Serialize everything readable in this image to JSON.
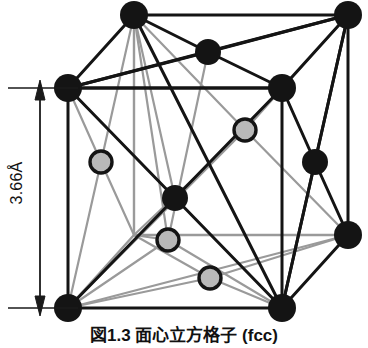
{
  "figure": {
    "caption": "図1.3  面心立方格子 (fcc)",
    "dimension_label": "3.66Å",
    "lattice_type": "fcc",
    "lattice_parameter": "3.66",
    "lattice_parameter_unit": "Å"
  },
  "colors": {
    "atom_dark_fill": "#141414",
    "atom_light_fill": "#b9b9b9",
    "atom_light_stroke": "#141414",
    "bond_front": "#141414",
    "bond_back": "#9a9a9a",
    "dimension_line": "#1a1a1a",
    "background": "#ffffff"
  },
  "geometry": {
    "projection": "oblique",
    "depth_offset_x": 66,
    "depth_offset_y": -73,
    "cube_front": {
      "top_left": [
        68,
        88
      ],
      "top_right": [
        282,
        88
      ],
      "bottom_right": [
        282,
        308
      ],
      "bottom_left": [
        68,
        308
      ]
    },
    "cube_back": {
      "top_left": [
        134,
        15
      ],
      "top_right": [
        348,
        15
      ],
      "bottom_right": [
        348,
        235
      ],
      "bottom_left": [
        134,
        235
      ]
    }
  },
  "atoms": {
    "corner_atoms": [
      {
        "name": "corner-front-top-left",
        "x": 68,
        "y": 88,
        "r": 13,
        "shade": "dark"
      },
      {
        "name": "corner-front-top-right",
        "x": 282,
        "y": 88,
        "r": 13,
        "shade": "dark"
      },
      {
        "name": "corner-front-bottom-left",
        "x": 68,
        "y": 308,
        "r": 13,
        "shade": "dark"
      },
      {
        "name": "corner-front-bottom-right",
        "x": 282,
        "y": 308,
        "r": 13,
        "shade": "dark"
      },
      {
        "name": "corner-back-top-left",
        "x": 134,
        "y": 15,
        "r": 13,
        "shade": "dark"
      },
      {
        "name": "corner-back-top-right",
        "x": 348,
        "y": 15,
        "r": 13,
        "shade": "dark"
      },
      {
        "name": "corner-back-bottom-right",
        "x": 348,
        "y": 235,
        "r": 13,
        "shade": "dark"
      },
      {
        "name": "corner-back-bottom-left",
        "x": 134,
        "y": 235,
        "r": 13,
        "shade": "hidden"
      }
    ],
    "face_center_atoms": [
      {
        "name": "face-center-top",
        "x": 208,
        "y": 52,
        "r": 13,
        "shade": "dark"
      },
      {
        "name": "face-center-front",
        "x": 175,
        "y": 198,
        "r": 13,
        "shade": "dark"
      },
      {
        "name": "face-center-right",
        "x": 315,
        "y": 162,
        "r": 13,
        "shade": "dark"
      },
      {
        "name": "face-center-back",
        "x": 245,
        "y": 130,
        "r": 11,
        "shade": "light"
      },
      {
        "name": "face-center-left",
        "x": 101,
        "y": 162,
        "r": 11,
        "shade": "light"
      },
      {
        "name": "face-center-bottom-left",
        "x": 168,
        "y": 240,
        "r": 11,
        "shade": "light"
      },
      {
        "name": "face-center-bottom",
        "x": 210,
        "y": 278,
        "r": 11,
        "shade": "light"
      }
    ]
  },
  "dimension": {
    "axis_x": 40,
    "top_tick_y": 88,
    "bottom_tick_y": 308,
    "tick_left": 8,
    "tick_right": 78
  }
}
